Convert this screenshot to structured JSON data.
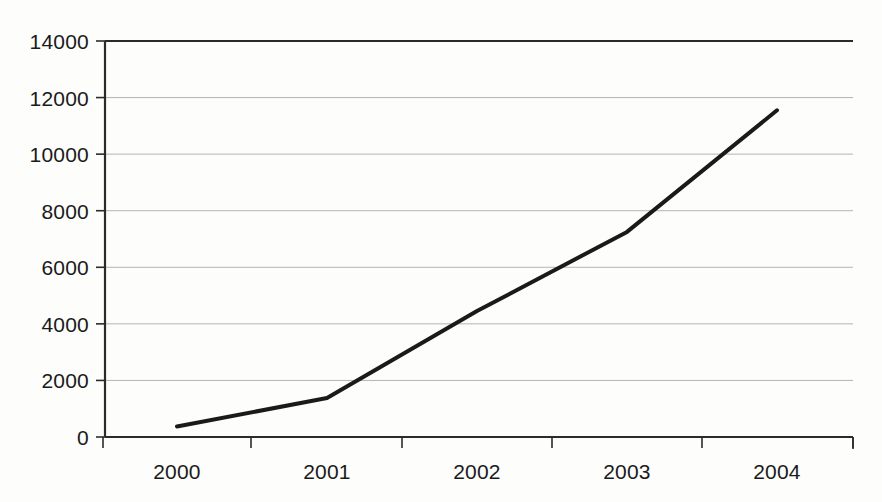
{
  "chart_data": {
    "type": "line",
    "title": "",
    "subtitle": "",
    "xlabel": "",
    "ylabel": "",
    "categories": [
      "2000",
      "2001",
      "2002",
      "2003",
      "2004"
    ],
    "values": [
      370,
      1380,
      4450,
      7250,
      11550
    ],
    "series": [
      {
        "name": "",
        "values": [
          370,
          1380,
          4450,
          7250,
          11550
        ],
        "color": "#1a1a1a",
        "line_width": 4
      }
    ],
    "ylim": [
      0,
      14000
    ],
    "ytick_values": [
      0,
      2000,
      4000,
      6000,
      8000,
      10000,
      12000,
      14000
    ],
    "ytick_labels": [
      "0",
      "2000",
      "4000",
      "6000",
      "8000",
      "10000",
      "12000",
      "14000"
    ],
    "xtick_labels": [
      "2000",
      "2001",
      "2002",
      "2003",
      "2004"
    ],
    "grid": true,
    "grid_axis": "y",
    "grid_color": "#b4b4b4",
    "axis_color": "#2b2b2b",
    "legend": false,
    "legend_position": "none",
    "markers": false,
    "background_color": "#fdfdfc",
    "annotations": []
  },
  "geometry": {
    "plot_left": 105,
    "plot_right": 853,
    "plot_top": 41,
    "plot_bottom": 437,
    "x_tick_positions": [
      103,
      251,
      402,
      552,
      702,
      853
    ],
    "x_label_positions": [
      177,
      327,
      477,
      627,
      777
    ],
    "y_tick_positions": [
      437,
      380,
      323,
      267,
      210,
      153,
      97,
      41
    ]
  }
}
